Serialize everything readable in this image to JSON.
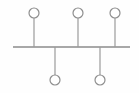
{
  "canvas": {
    "width": 139,
    "height": 93,
    "background_color": "#fefefe",
    "title": "Bus topology node diagram"
  },
  "style": {
    "trunk_color": "#8b8b8b",
    "stem_color": "#9a9a9a",
    "node_stroke_color": "#8e8e8e",
    "node_fill_color": "#ffffff",
    "trunk_stroke_width": 1.6,
    "stem_stroke_width": 1.2,
    "node_stroke_width": 1.2,
    "node_radius": 5
  },
  "chart_data": {
    "type": "diagram",
    "trunk": {
      "label": "trunk-line",
      "x1": 13,
      "y1": 47,
      "x2": 130,
      "y2": 47
    },
    "nodes": [
      {
        "id": "node-top-1",
        "label": "",
        "cx": 34,
        "cy": 13,
        "r": 5,
        "side": "top",
        "stem_x": 34,
        "stem_y1": 18,
        "stem_y2": 47
      },
      {
        "id": "node-top-2",
        "label": "",
        "cx": 78,
        "cy": 13,
        "r": 5,
        "side": "top",
        "stem_x": 78,
        "stem_y1": 18,
        "stem_y2": 47
      },
      {
        "id": "node-top-3",
        "label": "",
        "cx": 115,
        "cy": 13,
        "r": 5,
        "side": "top",
        "stem_x": 115,
        "stem_y1": 18,
        "stem_y2": 47
      },
      {
        "id": "node-bottom-1",
        "label": "",
        "cx": 55,
        "cy": 80,
        "r": 5,
        "side": "bottom",
        "stem_x": 55,
        "stem_y1": 47,
        "stem_y2": 75
      },
      {
        "id": "node-bottom-2",
        "label": "",
        "cx": 100,
        "cy": 80,
        "r": 5,
        "side": "bottom",
        "stem_x": 100,
        "stem_y1": 47,
        "stem_y2": 75
      }
    ],
    "counts": {
      "total_nodes": 5,
      "top_nodes": 3,
      "bottom_nodes": 2,
      "stems": 5
    }
  }
}
